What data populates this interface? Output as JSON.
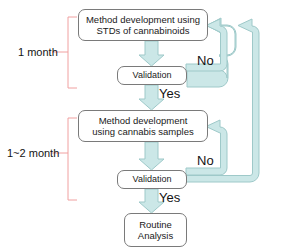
{
  "diagram": {
    "colors": {
      "arrow_fill": "#cbe7e7",
      "arrow_stroke": "#9ec9c9",
      "box_stroke": "#7a7a7a",
      "box_fill": "#ffffff",
      "bracket_stroke": "#f0a0a0",
      "text": "#131313",
      "background": "#ffffff"
    },
    "nodes": [
      {
        "id": "method-std",
        "label": "Method development using\nSTDs of cannabinoids",
        "shape": "rounded-rectangle"
      },
      {
        "id": "validation-1",
        "label": "Validation",
        "shape": "rounded-rectangle"
      },
      {
        "id": "method-samples",
        "label": "Method development\nusing cannabis samples",
        "shape": "rounded-rectangle"
      },
      {
        "id": "validation-2",
        "label": "Validation",
        "shape": "rounded-rectangle"
      },
      {
        "id": "routine",
        "label": "Routine\nAnalysis",
        "shape": "rounded-rectangle"
      }
    ],
    "edge_labels": {
      "no_1": "No",
      "yes_1": "Yes",
      "no_2": "No",
      "yes_2": "Yes"
    },
    "brackets": [
      {
        "id": "duration-1",
        "label": "1 month"
      },
      {
        "id": "duration-2",
        "label": "1~2 month"
      }
    ],
    "edges": [
      {
        "from": "method-std",
        "to": "validation-1",
        "label": "",
        "direction": "down"
      },
      {
        "from": "validation-1",
        "to": "method-std",
        "label": "No",
        "direction": "loop-right-up"
      },
      {
        "from": "validation-1",
        "to": "method-samples",
        "label": "Yes",
        "direction": "down"
      },
      {
        "from": "method-samples",
        "to": "validation-2",
        "label": "",
        "direction": "down"
      },
      {
        "from": "validation-2",
        "to": "method-samples",
        "label": "No",
        "direction": "loop-right-up"
      },
      {
        "from": "validation-2",
        "to": "method-std",
        "label": "No",
        "direction": "loop-far-right-up"
      },
      {
        "from": "validation-2",
        "to": "routine",
        "label": "Yes",
        "direction": "down"
      }
    ]
  }
}
